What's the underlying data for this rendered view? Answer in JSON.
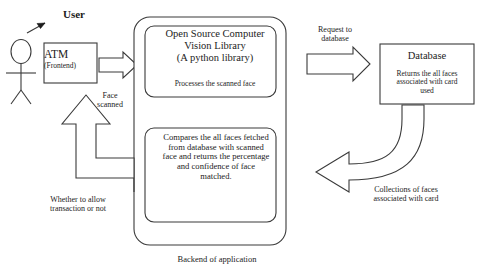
{
  "diagram": {
    "title": "Backend of application",
    "actor": {
      "label": "User",
      "icon": "stick-figure-icon"
    },
    "frontend": {
      "title": "ATM",
      "subtitle": "(Frontend)"
    },
    "flows": {
      "face_scanned": "Face\nscanned",
      "whether_allow": "Whether to allow\ntransaction or not",
      "request_to_database": "Request to\ndatabase",
      "collections_of_faces": "Collections of faces\nassociated with card"
    },
    "backend": {
      "caption": "Backend of application",
      "boxes": [
        {
          "title": "Open Source Computer\nVision Library\n(A python library)",
          "subtitle": "Processes the scanned face"
        },
        {
          "body": "Compares the all faces fetched\nfrom database with scanned\nface and returns the percentage\nand confidence of face\nmatched."
        }
      ]
    },
    "database": {
      "title": "Database",
      "subtitle": "Returns the all faces\nassociated with card\nused"
    },
    "colors": {
      "stroke": "#3a3a3a",
      "text": "#1c1c1c",
      "background": "#ffffff"
    }
  }
}
